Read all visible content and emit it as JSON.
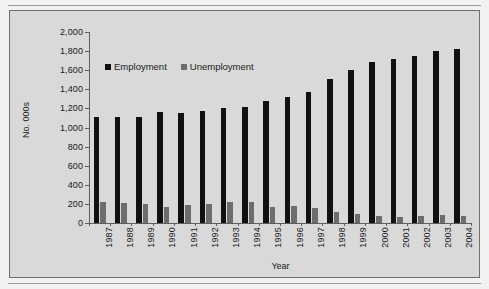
{
  "figure": {
    "background_color": "#d9d9d9",
    "border_color": "#6f6f6f"
  },
  "chart_data": {
    "type": "bar",
    "title": "",
    "xlabel": "Year",
    "ylabel": "No. 000s",
    "ylim": [
      0,
      2000
    ],
    "ytick_step": 200,
    "yticks": [
      "0",
      "200",
      "400",
      "600",
      "800",
      "1,000",
      "1,200",
      "1,400",
      "1,600",
      "1,800",
      "2,000"
    ],
    "grid": false,
    "legend_position": "upper-left-inside",
    "categories": [
      "1987",
      "1988",
      "1989",
      "1990",
      "1991",
      "1992",
      "1993",
      "1994",
      "1995",
      "1996",
      "1997",
      "1998",
      "1999",
      "2000",
      "2001",
      "2002",
      "2003",
      "2004"
    ],
    "series": [
      {
        "name": "Employment",
        "color": "#111111",
        "values": [
          1115,
          1112,
          1108,
          1160,
          1152,
          1178,
          1200,
          1218,
          1275,
          1323,
          1370,
          1505,
          1600,
          1685,
          1715,
          1752,
          1805,
          1818
        ]
      },
      {
        "name": "Unemployment",
        "color": "#6d6d6d",
        "values": [
          218,
          208,
          195,
          172,
          188,
          202,
          225,
          215,
          170,
          175,
          152,
          118,
          90,
          72,
          58,
          78,
          85,
          78
        ]
      }
    ]
  }
}
